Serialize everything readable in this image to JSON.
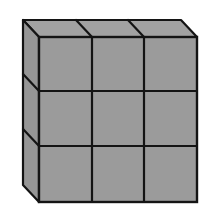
{
  "diagram": {
    "description": "3x3 wall of cubes drawn in oblique projection",
    "rows": 3,
    "columns": 3,
    "layers": 1,
    "total_cubes": 9,
    "colors": {
      "background": "#ffffff",
      "face_fill": "#9b9b9b",
      "top_fill": "#a2a2a2",
      "side_fill": "#969696",
      "edge": "#141414"
    },
    "geometry": {
      "front": {
        "x0": 39,
        "y0": 37,
        "x1": 197,
        "y1": 202
      },
      "depth_dx": -16,
      "depth_dy": -17,
      "col_lines_x": [
        92,
        144
      ],
      "row_lines_y": [
        91,
        146
      ]
    }
  }
}
